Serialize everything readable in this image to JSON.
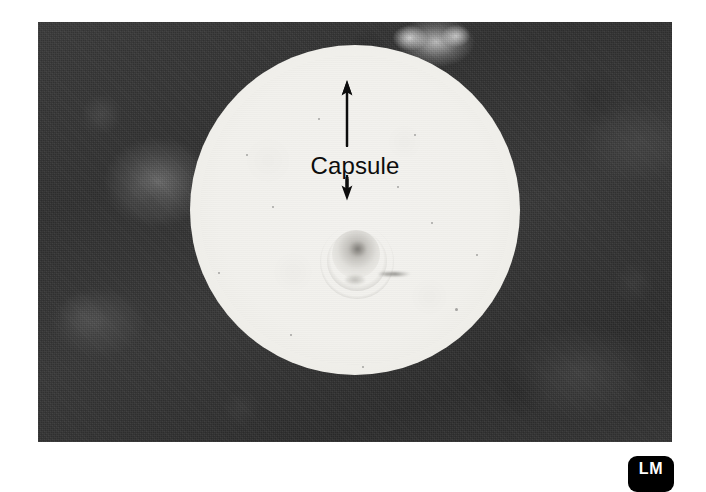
{
  "figure": {
    "type": "light-micrograph",
    "background_color": "#323232",
    "capsule_color": "#f1f0ec",
    "annotation_color": "#0d0d0d"
  },
  "annotations": {
    "capsule_label": "Capsule",
    "arrow_up": "arrow-pointing-up",
    "arrow_down": "arrow-pointing-down"
  },
  "badge": {
    "label": "LM",
    "meaning": "Light Micrograph",
    "background_color": "#000000",
    "text_color": "#ffffff"
  },
  "specks": [
    {
      "x": 272,
      "y": 206,
      "size": 2
    },
    {
      "x": 246,
      "y": 154,
      "size": 2
    },
    {
      "x": 431,
      "y": 222,
      "size": 2
    },
    {
      "x": 397,
      "y": 186,
      "size": 2
    },
    {
      "x": 290,
      "y": 334,
      "size": 2
    },
    {
      "x": 455,
      "y": 308,
      "size": 3
    },
    {
      "x": 218,
      "y": 272,
      "size": 2
    },
    {
      "x": 362,
      "y": 366,
      "size": 2
    },
    {
      "x": 476,
      "y": 254,
      "size": 2
    },
    {
      "x": 318,
      "y": 118,
      "size": 2
    },
    {
      "x": 234,
      "y": 338,
      "size": 2
    },
    {
      "x": 414,
      "y": 134,
      "size": 2
    }
  ]
}
